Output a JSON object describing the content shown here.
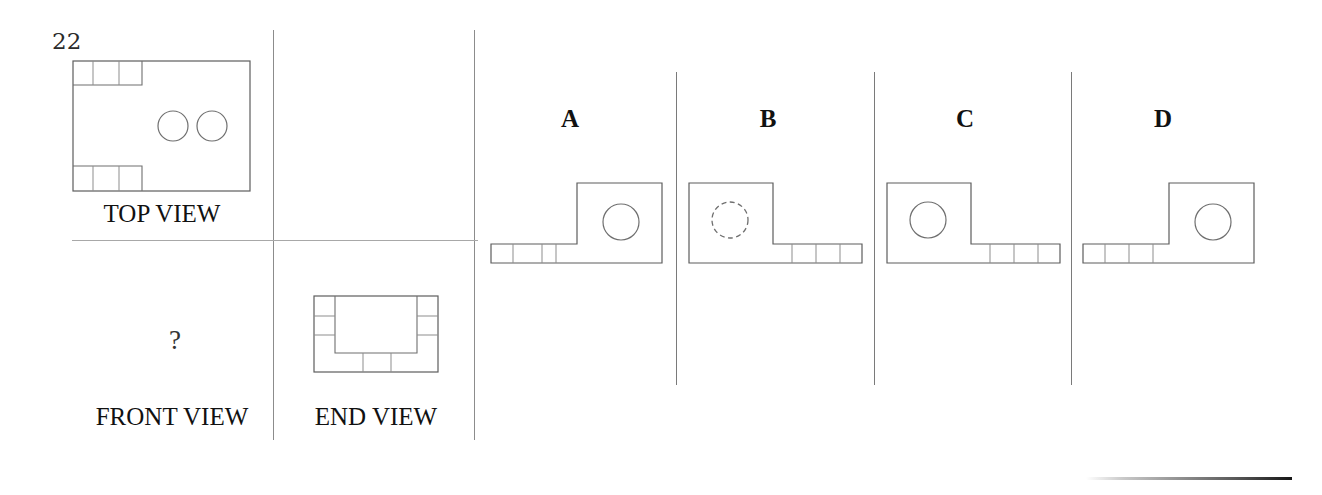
{
  "question": {
    "number": "22",
    "prompt_symbol": "?"
  },
  "given_views": [
    {
      "id": "top-view",
      "label": "TOP VIEW",
      "holes": 2,
      "hole_style": "solid"
    },
    {
      "id": "front-view",
      "label": "FRONT VIEW",
      "holes": 0,
      "hole_style": "unknown"
    },
    {
      "id": "end-view",
      "label": "END VIEW",
      "holes": 0,
      "hole_style": "none"
    }
  ],
  "answer_options": [
    {
      "letter": "A",
      "orientation": "block-right",
      "hole_style": "solid",
      "strip_side": "left",
      "strip_segments": 3
    },
    {
      "letter": "B",
      "orientation": "block-left",
      "hole_style": "dashed",
      "strip_side": "right",
      "strip_segments": 4
    },
    {
      "letter": "C",
      "orientation": "block-left",
      "hole_style": "solid",
      "strip_side": "right",
      "strip_segments": 4
    },
    {
      "letter": "D",
      "orientation": "block-right",
      "hole_style": "solid",
      "strip_side": "left",
      "strip_segments": 4
    }
  ],
  "colors": {
    "line": "#6f6f6f",
    "rule": "#8c8c8c",
    "text": "#111111",
    "background": "#ffffff"
  }
}
